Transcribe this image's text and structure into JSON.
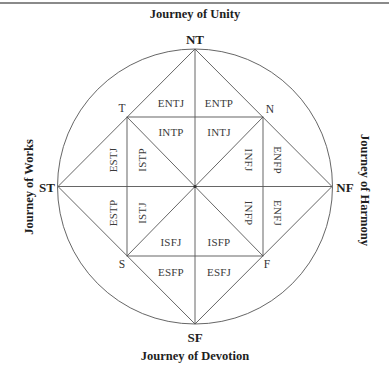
{
  "diagram": {
    "journeys": {
      "top": "Journey of Unity",
      "bottom": "Journey of Devotion",
      "left": "Journey of Works",
      "right": "Journey of Harmony"
    },
    "poles": {
      "top": "NT",
      "bottom": "SF",
      "left": "ST",
      "right": "NF"
    },
    "corners": {
      "top_left": "T",
      "top_right": "N",
      "bottom_left": "S",
      "bottom_right": "F"
    },
    "types": {
      "outer_top_left": "ENTJ",
      "outer_top_right": "ENTP",
      "inner_top_left": "INTP",
      "inner_top_right": "INTJ",
      "outer_left_top": "ESTJ",
      "outer_left_bottom": "ESTP",
      "inner_left_top": "ISTP",
      "inner_left_bottom": "ISTJ",
      "outer_right_top": "ENFP",
      "outer_right_bottom": "ENFJ",
      "inner_right_top": "INFJ",
      "inner_right_bottom": "INFP",
      "inner_bottom_left": "ISFJ",
      "inner_bottom_right": "ISFP",
      "outer_bottom_left": "ESFP",
      "outer_bottom_right": "ESFJ"
    },
    "colors": {
      "line": "#555555",
      "text": "#2a2a2a",
      "rule": "#8a8a8a"
    }
  }
}
